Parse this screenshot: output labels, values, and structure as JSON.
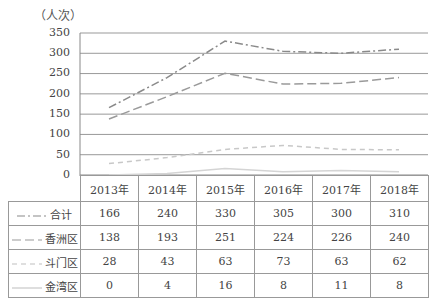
{
  "chart_data": {
    "type": "line",
    "title": "",
    "unit_label": "（人次）",
    "xlabel": "",
    "ylabel": "人次",
    "ylim": [
      0,
      350
    ],
    "yticks": [
      "350",
      "300",
      "250",
      "200",
      "150",
      "100",
      "50",
      "0"
    ],
    "grid": true,
    "legend_position": "table-left",
    "categories": [
      "2013年",
      "2014年",
      "2015年",
      "2016年",
      "2017年",
      "2018年"
    ],
    "series": [
      {
        "name": "合计",
        "values": [
          166,
          240,
          330,
          305,
          300,
          310
        ],
        "color": "#8a8a8a",
        "dash": "8,3,2,3"
      },
      {
        "name": "香洲区",
        "values": [
          138,
          193,
          251,
          224,
          226,
          240
        ],
        "color": "#9a9a9a",
        "dash": "9,4"
      },
      {
        "name": "斗门区",
        "values": [
          28,
          43,
          63,
          73,
          63,
          62
        ],
        "color": "#c8c8c8",
        "dash": "5,4"
      },
      {
        "name": "金湾区",
        "values": [
          0,
          4,
          16,
          8,
          11,
          8
        ],
        "color": "#d4d4d4",
        "dash": ""
      }
    ]
  },
  "table": {
    "header": [
      "2013年",
      "2014年",
      "2015年",
      "2016年",
      "2017年",
      "2018年"
    ],
    "rows": [
      {
        "label": "合计",
        "cells": [
          "166",
          "240",
          "330",
          "305",
          "300",
          "310"
        ]
      },
      {
        "label": "香洲区",
        "cells": [
          "138",
          "193",
          "251",
          "224",
          "226",
          "240"
        ]
      },
      {
        "label": "斗门区",
        "cells": [
          "28",
          "43",
          "63",
          "73",
          "63",
          "62"
        ]
      },
      {
        "label": "金湾区",
        "cells": [
          "0",
          "4",
          "16",
          "8",
          "11",
          "8"
        ]
      }
    ]
  }
}
